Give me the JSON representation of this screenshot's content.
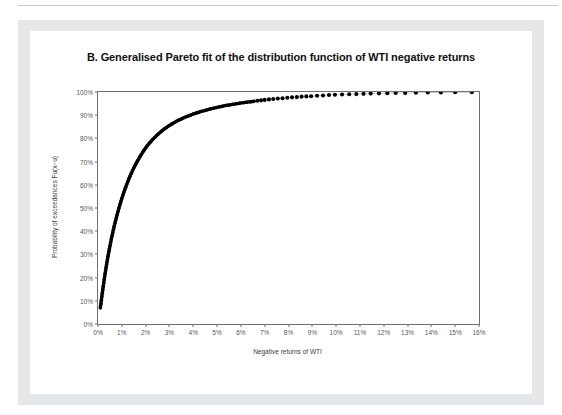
{
  "page": {
    "background_color": "#ffffff",
    "mat_color": "#e6e7e8",
    "panel_color": "#ffffff",
    "rule_color": "#c9c9cb"
  },
  "chart_data": {
    "type": "scatter",
    "title": "B. Generalised Pareto fit of the distribution function of WTI negative returns",
    "xlabel": "Negative returns of WTI",
    "ylabel": "Probability of exceedances Fu(x−u)",
    "xlim": [
      0,
      16
    ],
    "ylim": [
      0,
      100
    ],
    "grid": false,
    "legend": null,
    "marker_color": "#000000",
    "axis_color": "#6f7072",
    "x_tick_labels": [
      "0%",
      "1%",
      "2%",
      "3%",
      "4%",
      "5%",
      "6%",
      "7%",
      "8%",
      "9%",
      "10%",
      "11%",
      "12%",
      "13%",
      "14%",
      "15%",
      "16%"
    ],
    "x_ticks": [
      0,
      1,
      2,
      3,
      4,
      5,
      6,
      7,
      8,
      9,
      10,
      11,
      12,
      13,
      14,
      15,
      16
    ],
    "y_tick_labels": [
      "0%",
      "10%",
      "20%",
      "30%",
      "40%",
      "50%",
      "60%",
      "70%",
      "80%",
      "90%",
      "100%"
    ],
    "y_ticks": [
      0,
      10,
      20,
      30,
      40,
      50,
      60,
      70,
      80,
      90,
      100
    ],
    "series": [
      {
        "name": "Generalised Pareto fit of WTI negative returns",
        "x": [
          0.1,
          0.12,
          0.14,
          0.16,
          0.18,
          0.2,
          0.22,
          0.24,
          0.26,
          0.28,
          0.3,
          0.32,
          0.34,
          0.36,
          0.38,
          0.4,
          0.42,
          0.44,
          0.46,
          0.48,
          0.5,
          0.53,
          0.56,
          0.59,
          0.62,
          0.65,
          0.68,
          0.71,
          0.74,
          0.77,
          0.8,
          0.84,
          0.88,
          0.92,
          0.96,
          1.0,
          1.04,
          1.08,
          1.12,
          1.16,
          1.2,
          1.25,
          1.3,
          1.35,
          1.4,
          1.45,
          1.5,
          1.55,
          1.6,
          1.65,
          1.7,
          1.76,
          1.82,
          1.88,
          1.94,
          2.0,
          2.06,
          2.12,
          2.18,
          2.24,
          2.3,
          2.38,
          2.46,
          2.54,
          2.62,
          2.7,
          2.78,
          2.86,
          2.94,
          3.02,
          3.1,
          3.2,
          3.3,
          3.4,
          3.5,
          3.6,
          3.7,
          3.8,
          3.9,
          4.0,
          4.12,
          4.24,
          4.36,
          4.48,
          4.6,
          4.72,
          4.84,
          4.96,
          5.1,
          5.24,
          5.38,
          5.52,
          5.66,
          5.8,
          5.95,
          6.1,
          6.25,
          6.4,
          6.55,
          6.7,
          6.85,
          7.0,
          7.18,
          7.36,
          7.55,
          7.75,
          7.95,
          8.15,
          8.35,
          8.55,
          8.75,
          8.95,
          9.2,
          9.45,
          9.7,
          9.95,
          10.25,
          10.55,
          10.85,
          11.15,
          11.45,
          11.8,
          12.15,
          12.5,
          12.9,
          13.35,
          13.85,
          14.4,
          15.0,
          15.7
        ],
        "y": [
          7.0,
          8.6,
          10.2,
          11.8,
          13.3,
          14.8,
          16.3,
          17.7,
          19.1,
          20.5,
          21.8,
          23.1,
          24.4,
          25.6,
          26.8,
          28.0,
          29.2,
          30.3,
          31.4,
          32.5,
          33.6,
          35.1,
          36.6,
          38.0,
          39.4,
          40.8,
          42.1,
          43.4,
          44.6,
          45.8,
          47.0,
          48.5,
          50.0,
          51.4,
          52.8,
          54.1,
          55.4,
          56.6,
          57.8,
          58.9,
          60.0,
          61.3,
          62.6,
          63.8,
          65.0,
          66.1,
          67.2,
          68.2,
          69.2,
          70.1,
          71.0,
          72.1,
          73.1,
          74.1,
          75.0,
          75.9,
          76.7,
          77.5,
          78.2,
          78.9,
          79.6,
          80.4,
          81.2,
          82.0,
          82.7,
          83.4,
          84.0,
          84.6,
          85.2,
          85.7,
          86.2,
          86.8,
          87.4,
          87.9,
          88.4,
          88.9,
          89.3,
          89.7,
          90.1,
          90.5,
          90.9,
          91.3,
          91.7,
          92.0,
          92.4,
          92.7,
          93.0,
          93.3,
          93.6,
          93.9,
          94.2,
          94.4,
          94.7,
          94.9,
          95.2,
          95.4,
          95.6,
          95.8,
          96.0,
          96.2,
          96.4,
          96.6,
          96.8,
          97.0,
          97.2,
          97.3,
          97.5,
          97.7,
          97.8,
          98.0,
          98.1,
          98.2,
          98.4,
          98.5,
          98.7,
          98.8,
          98.9,
          99.0,
          99.1,
          99.2,
          99.3,
          99.4,
          99.5,
          99.6,
          99.6,
          99.7,
          99.8,
          99.8,
          99.9,
          99.9
        ]
      }
    ]
  }
}
